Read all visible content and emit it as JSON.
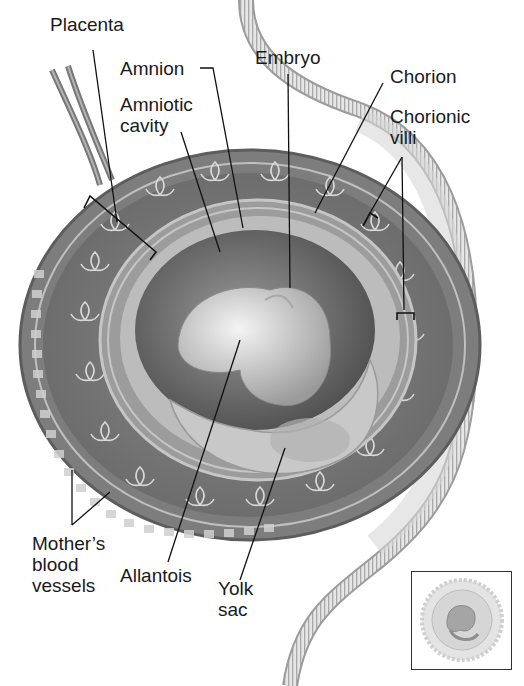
{
  "diagram": {
    "type": "labeled-anatomical-illustration",
    "labels": [
      {
        "id": "placenta",
        "text": "Placenta",
        "x": 50,
        "y": 14
      },
      {
        "id": "amnion",
        "text": "Amnion",
        "x": 120,
        "y": 58
      },
      {
        "id": "amniotic-cavity",
        "text": "Amniotic\ncavity",
        "x": 120,
        "y": 94
      },
      {
        "id": "embryo",
        "text": "Embryo",
        "x": 255,
        "y": 47
      },
      {
        "id": "chorion",
        "text": "Chorion",
        "x": 390,
        "y": 66
      },
      {
        "id": "chorionic-villi",
        "text": "Chorionic\nvilli",
        "x": 390,
        "y": 106
      },
      {
        "id": "mothers-blood-vessels",
        "text": "Mother’s\nblood\nvessels",
        "x": 32,
        "y": 533
      },
      {
        "id": "allantois",
        "text": "Allantois",
        "x": 120,
        "y": 565
      },
      {
        "id": "yolk-sac",
        "text": "Yolk\nsac",
        "x": 218,
        "y": 578
      }
    ],
    "inset": {
      "description": "small thumbnail of the whole embryo and membranes"
    },
    "colors": {
      "tissue": "#7a7a7a",
      "tissue_dark": "#5a5a5a",
      "membrane": "#c9c9c9",
      "cavity": "#6e6e6e",
      "embryo": "#d8d8d8",
      "uterine_wall": "#e2e2e2",
      "text": "#1a1a1a"
    }
  }
}
